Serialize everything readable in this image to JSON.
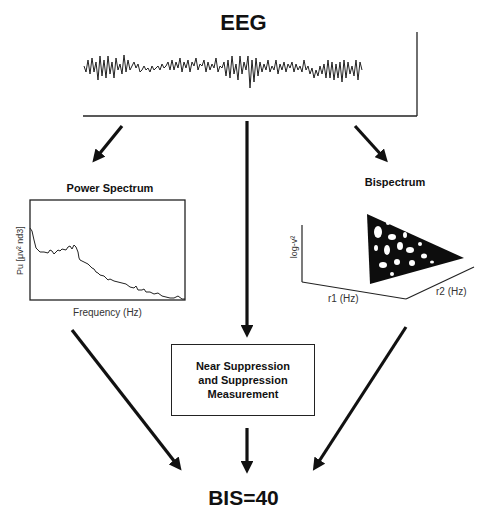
{
  "title": "EEG",
  "eeg_panel": {
    "signal_name": "EEG raw waveform"
  },
  "power_spectrum": {
    "title": "Power Spectrum",
    "ylabel": "Pu [μv² nd3]",
    "xlabel": "Frequency (Hz)"
  },
  "bispectrum": {
    "title": "Bispectrum",
    "zlabel": "log-v²",
    "xlabel": "r1 (Hz)",
    "ylabel": "r2 (Hz)"
  },
  "suppression_box": {
    "line1": "Near Suppression",
    "line2": "and Suppression",
    "line3": "Measurement"
  },
  "result": "BIS=40",
  "flow": {
    "nodes": [
      "EEG",
      "Power Spectrum",
      "Bispectrum",
      "Near Suppression and Suppression Measurement",
      "BIS=40"
    ],
    "edges": [
      [
        "EEG",
        "Power Spectrum"
      ],
      [
        "EEG",
        "Bispectrum"
      ],
      [
        "EEG",
        "Near Suppression and Suppression Measurement"
      ],
      [
        "Power Spectrum",
        "BIS=40"
      ],
      [
        "Bispectrum",
        "BIS=40"
      ],
      [
        "Near Suppression and Suppression Measurement",
        "BIS=40"
      ]
    ]
  },
  "colors": {
    "ink": "#111111",
    "background": "#ffffff"
  }
}
